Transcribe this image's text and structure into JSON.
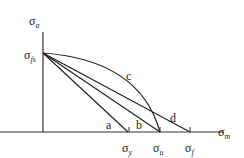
{
  "diagram": {
    "type": "fatigue-diagram",
    "axes": {
      "y_label": {
        "symbol": "σ",
        "subscript": "a"
      },
      "x_label": {
        "symbol": "σ",
        "subscript": "m"
      }
    },
    "y_intercept_label": {
      "symbol": "σ",
      "subscript": "fs"
    },
    "x_intercepts": [
      {
        "symbol": "σ",
        "subscript": "y"
      },
      {
        "symbol": "σ",
        "subscript": "u"
      },
      {
        "symbol": "σ",
        "subscript": "f"
      }
    ],
    "curves": [
      {
        "label": "a",
        "kind": "line",
        "ends_at": "σy"
      },
      {
        "label": "b",
        "kind": "line",
        "ends_at": "σu"
      },
      {
        "label": "c",
        "kind": "curve",
        "ends_at": "σu"
      },
      {
        "label": "d",
        "kind": "line",
        "ends_at": "σf"
      }
    ]
  }
}
